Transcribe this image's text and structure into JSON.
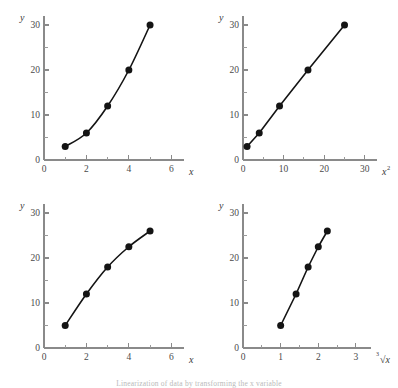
{
  "figure": {
    "background_color": "#ffffff",
    "ink_color": "#141414",
    "axis_color": "#8a8a8a",
    "caption": "Linearization of data by transforming the x variable"
  },
  "chart_data": [
    {
      "type": "scatter",
      "panel": "top-left",
      "title": "",
      "xlabel": "x",
      "ylabel": "y",
      "xlim": [
        0,
        6.6
      ],
      "ylim": [
        0,
        32
      ],
      "grid": false,
      "legend": "none",
      "x_ticks": [
        0,
        2,
        4,
        6
      ],
      "x_tick_labels": [
        "0",
        "2",
        "4",
        "6"
      ],
      "x_minor_ticks": [
        1,
        3,
        5
      ],
      "y_ticks": [
        0,
        10,
        20,
        30
      ],
      "y_tick_labels": [
        "0",
        "10",
        "20",
        "30"
      ],
      "y_minor_ticks": [
        5,
        15,
        25
      ],
      "x": [
        1,
        2,
        3,
        4,
        5
      ],
      "values": [
        3,
        6,
        12,
        20,
        30
      ],
      "connected": true,
      "curve_shape": "concave-up"
    },
    {
      "type": "scatter",
      "panel": "top-right",
      "title": "",
      "xlabel": "x²",
      "xlabel_base": "x",
      "xlabel_sup": "2",
      "ylabel": "y",
      "xlim": [
        0,
        33
      ],
      "ylim": [
        0,
        32
      ],
      "grid": false,
      "legend": "none",
      "x_ticks": [
        0,
        10,
        20,
        30
      ],
      "x_tick_labels": [
        "0",
        "10",
        "20",
        "30"
      ],
      "x_minor_ticks": [
        5,
        15,
        25
      ],
      "y_ticks": [
        0,
        10,
        20,
        30
      ],
      "y_tick_labels": [
        "0",
        "10",
        "20",
        "30"
      ],
      "y_minor_ticks": [
        5,
        15,
        25
      ],
      "x": [
        1,
        4,
        9,
        16,
        25
      ],
      "values": [
        3,
        6,
        12,
        20,
        30
      ],
      "connected": true,
      "curve_shape": "linear"
    },
    {
      "type": "scatter",
      "panel": "bottom-left",
      "title": "",
      "xlabel": "x",
      "ylabel": "y",
      "xlim": [
        0,
        6.6
      ],
      "ylim": [
        0,
        32
      ],
      "grid": false,
      "legend": "none",
      "x_ticks": [
        0,
        2,
        4,
        6
      ],
      "x_tick_labels": [
        "0",
        "2",
        "4",
        "6"
      ],
      "x_minor_ticks": [
        1,
        3,
        5
      ],
      "y_ticks": [
        0,
        10,
        20,
        30
      ],
      "y_tick_labels": [
        "0",
        "10",
        "20",
        "30"
      ],
      "y_minor_ticks": [
        5,
        15,
        25
      ],
      "x": [
        1,
        2,
        3,
        4,
        5
      ],
      "values": [
        5,
        12,
        18,
        22.5,
        26
      ],
      "connected": true,
      "curve_shape": "concave-down"
    },
    {
      "type": "scatter",
      "panel": "bottom-right",
      "title": "",
      "xlabel": "√x",
      "xlabel_radical": "√",
      "xlabel_radicand": "x",
      "ylabel": "y",
      "xlim": [
        0,
        3.4
      ],
      "ylim": [
        0,
        32
      ],
      "grid": false,
      "legend": "none",
      "x_ticks": [
        0,
        1,
        2,
        3
      ],
      "x_tick_labels": [
        "0",
        "1",
        "2",
        "3"
      ],
      "x_minor_ticks": [
        0.5,
        1.5,
        2.5
      ],
      "y_ticks": [
        0,
        10,
        20,
        30
      ],
      "y_tick_labels": [
        "0",
        "10",
        "20",
        "30"
      ],
      "y_minor_ticks": [
        5,
        15,
        25
      ],
      "x": [
        1,
        1.41,
        1.73,
        2.0,
        2.24
      ],
      "values": [
        5,
        12,
        18,
        22.5,
        26
      ],
      "connected": true,
      "curve_shape": "linear"
    }
  ]
}
